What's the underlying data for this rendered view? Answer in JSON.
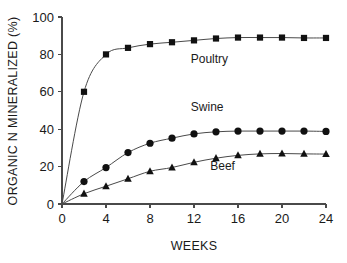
{
  "chart_data": {
    "type": "line",
    "title": "",
    "xlabel": "WEEKS",
    "ylabel": "ORGANIC N MINERALIZED (%)",
    "xlim": [
      0,
      24
    ],
    "ylim": [
      0,
      100
    ],
    "xticks": [
      0,
      4,
      8,
      12,
      16,
      20,
      24
    ],
    "yticks": [
      0,
      20,
      40,
      60,
      80,
      100
    ],
    "xtick_labels": [
      "0",
      "4",
      "8",
      "12",
      "16",
      "20",
      "24"
    ],
    "ytick_labels": [
      "0",
      "20",
      "40",
      "60",
      "80",
      "100"
    ],
    "grid": false,
    "legend_position": "inline-annotations",
    "x": [
      0,
      2,
      4,
      6,
      8,
      10,
      12,
      14,
      16,
      18,
      20,
      22,
      24
    ],
    "series": [
      {
        "name": "Poultry",
        "marker": "square",
        "color": "#111111",
        "label_x": 13.4,
        "label_y": 75.5,
        "values": [
          0,
          60,
          80,
          83.5,
          85.5,
          86.5,
          87.5,
          88.5,
          89,
          89,
          89,
          88.8,
          88.8
        ]
      },
      {
        "name": "Swine",
        "marker": "circle",
        "color": "#111111",
        "label_x": 13.2,
        "label_y": 49.5,
        "values": [
          0,
          12,
          19.5,
          27.5,
          32.5,
          35.2,
          37.5,
          38.6,
          39,
          39,
          39,
          39,
          38.8
        ]
      },
      {
        "name": "Beef",
        "marker": "triangle",
        "color": "#111111",
        "label_x": 14.6,
        "label_y": 18.0,
        "values": [
          0,
          5.5,
          9.5,
          13.5,
          17.5,
          19.5,
          22.3,
          24.5,
          26,
          26.8,
          27,
          26.8,
          26.7
        ]
      }
    ]
  },
  "figure": {
    "caption_fragment": ""
  }
}
